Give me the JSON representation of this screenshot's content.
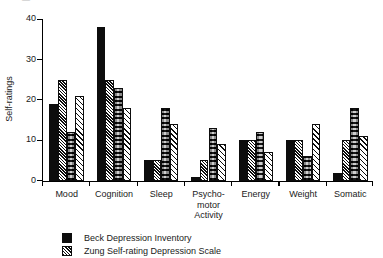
{
  "figure": {
    "y_axis_title": "Self-ratings",
    "top_clipped_artifact": [
      "—",
      "·",
      "·",
      "·",
      "·"
    ]
  },
  "chart_data": {
    "type": "bar",
    "title": "",
    "xlabel": "",
    "ylabel": "Self-ratings",
    "ylim": [
      0,
      40
    ],
    "yticks": [
      0,
      10,
      20,
      30,
      40
    ],
    "ytick_labels": [
      "0",
      "10",
      "20",
      "30",
      "40"
    ],
    "grid": false,
    "legend_position": "bottom-left",
    "categories": [
      "Mood",
      "Cognition",
      "Sleep",
      "Psycho-\nmotor\nActivity",
      "Energy",
      "Weight",
      "Somatic"
    ],
    "series": [
      {
        "name": "Beck Depression Inventory",
        "pattern": "solid-black",
        "values": [
          19,
          38,
          5,
          1,
          10,
          10,
          2
        ]
      },
      {
        "name": "Zung Self-rating Depression Scale",
        "pattern": "dense-diagonal-hatch",
        "values": [
          25,
          25,
          5,
          5,
          10,
          10,
          10
        ]
      },
      {
        "name": "series-3",
        "pattern": "stippled-gray",
        "values": [
          12,
          23,
          18,
          13,
          12,
          6,
          18
        ]
      },
      {
        "name": "series-4",
        "pattern": "light-diagonal-hatch",
        "values": [
          21,
          18,
          14,
          9,
          7,
          14,
          11
        ]
      }
    ]
  },
  "legend": {
    "items": [
      {
        "label": "Beck Depression Inventory",
        "swatch": "solid-black"
      },
      {
        "label": "Zung Self-rating Depression Scale",
        "swatch": "dense-diagonal-hatch"
      }
    ]
  }
}
